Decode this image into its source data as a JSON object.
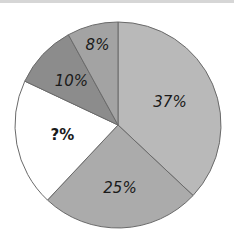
{
  "chart_data": {
    "type": "pie",
    "title": "",
    "start_angle_deg": 0,
    "direction": "clockwise",
    "slices": [
      {
        "label": "37%",
        "value": 37,
        "color": "#b9b9b9"
      },
      {
        "label": "25%",
        "value": 25,
        "color": "#ababab"
      },
      {
        "label": "?%",
        "value": 20,
        "color": "#ffffff",
        "unknown": true
      },
      {
        "label": "10%",
        "value": 10,
        "color": "#8c8c8c"
      },
      {
        "label": "8%",
        "value": 8,
        "color": "#a3a3a3"
      }
    ],
    "stroke_color": "#6a6a6a",
    "legend": "none"
  },
  "labels": {
    "s0": "37%",
    "s1": "25%",
    "s2": "?%",
    "s3": "10%",
    "s4": "8%"
  }
}
